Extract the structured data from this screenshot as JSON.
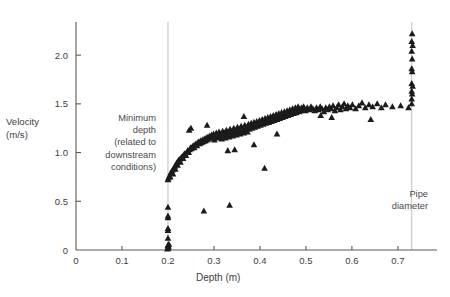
{
  "figure": {
    "background": "#ffffff",
    "marker_color": "#1b1b1b",
    "axis_color": "#5a5a5a",
    "reference_line_color": "#b9b9b9"
  },
  "labels": {
    "y_axis_line1": "Velocity",
    "y_axis_line2": "(m/s)",
    "x_axis": "Depth (m)",
    "annotation_left_line1": "Minimum",
    "annotation_left_line2": "depth",
    "annotation_left_line3": "(related to",
    "annotation_left_line4": "downstream",
    "annotation_left_line5": "conditions)",
    "annotation_right_line1": "Pipe",
    "annotation_right_line2": "diameter"
  },
  "chart_data": {
    "type": "scatter",
    "title": "",
    "xlabel": "Depth (m)",
    "ylabel": "Velocity (m/s)",
    "xlim": [
      0,
      0.785
    ],
    "ylim": [
      0,
      2.34
    ],
    "grid": false,
    "legend": null,
    "marker": "triangle-up",
    "marker_color": "#1b1b1b",
    "xticks": [
      0,
      0.1,
      0.2,
      0.3,
      0.4,
      0.5,
      0.6,
      0.7
    ],
    "xticklabels": [
      "0",
      "0.1",
      "0.2",
      "0.3",
      "0.4",
      "0.5",
      "0.6",
      "0.7"
    ],
    "yticks": [
      0,
      0.5,
      1.0,
      1.5,
      2.0
    ],
    "yticklabels": [
      "0",
      "0.5",
      "1.0",
      "1.5",
      "2.0"
    ],
    "annotations": [
      {
        "text": "Minimum depth (related to downstream conditions)",
        "x": 0.2,
        "type": "vertical-reference-line",
        "line_x": 0.2,
        "line_y_from": 0,
        "line_y_to": 2.34
      },
      {
        "text": "Pipe diameter",
        "x": 0.73,
        "type": "vertical-reference-line",
        "line_x": 0.73,
        "line_y_from": 0,
        "line_y_to": 2.34
      }
    ],
    "points": [
      [
        0.2,
        0.02
      ],
      [
        0.2,
        0.04
      ],
      [
        0.2,
        0.05
      ],
      [
        0.201,
        0.03
      ],
      [
        0.202,
        0.06
      ],
      [
        0.199,
        0.01
      ],
      [
        0.2,
        0.12
      ],
      [
        0.2,
        0.2
      ],
      [
        0.2,
        0.22
      ],
      [
        0.2,
        0.33
      ],
      [
        0.2,
        0.35
      ],
      [
        0.2,
        0.44
      ],
      [
        0.278,
        0.4
      ],
      [
        0.334,
        0.46
      ],
      [
        0.2,
        0.72
      ],
      [
        0.201,
        0.74
      ],
      [
        0.203,
        0.76
      ],
      [
        0.205,
        0.75
      ],
      [
        0.206,
        0.79
      ],
      [
        0.208,
        0.8
      ],
      [
        0.21,
        0.82
      ],
      [
        0.211,
        0.78
      ],
      [
        0.213,
        0.84
      ],
      [
        0.215,
        0.86
      ],
      [
        0.216,
        0.83
      ],
      [
        0.218,
        0.88
      ],
      [
        0.22,
        0.9
      ],
      [
        0.221,
        0.87
      ],
      [
        0.223,
        0.92
      ],
      [
        0.225,
        0.93
      ],
      [
        0.227,
        0.9
      ],
      [
        0.229,
        0.95
      ],
      [
        0.231,
        0.96
      ],
      [
        0.233,
        0.94
      ],
      [
        0.235,
        0.98
      ],
      [
        0.237,
        0.99
      ],
      [
        0.239,
        0.97
      ],
      [
        0.241,
        1.0
      ],
      [
        0.243,
        1.02
      ],
      [
        0.245,
        1.0
      ],
      [
        0.247,
        1.03
      ],
      [
        0.249,
        1.05
      ],
      [
        0.246,
        1.23
      ],
      [
        0.25,
        1.25
      ],
      [
        0.251,
        1.04
      ],
      [
        0.253,
        1.06
      ],
      [
        0.255,
        1.07
      ],
      [
        0.257,
        1.05
      ],
      [
        0.259,
        1.08
      ],
      [
        0.261,
        1.09
      ],
      [
        0.263,
        1.07
      ],
      [
        0.265,
        1.1
      ],
      [
        0.267,
        1.11
      ],
      [
        0.269,
        1.09
      ],
      [
        0.271,
        1.12
      ],
      [
        0.273,
        1.1
      ],
      [
        0.275,
        1.13
      ],
      [
        0.277,
        1.11
      ],
      [
        0.279,
        1.14
      ],
      [
        0.281,
        1.12
      ],
      [
        0.283,
        1.15
      ],
      [
        0.285,
        1.13
      ],
      [
        0.287,
        1.16
      ],
      [
        0.289,
        1.14
      ],
      [
        0.285,
        1.28
      ],
      [
        0.291,
        1.17
      ],
      [
        0.293,
        1.15
      ],
      [
        0.295,
        1.18
      ],
      [
        0.297,
        1.16
      ],
      [
        0.299,
        1.19
      ],
      [
        0.301,
        1.13
      ],
      [
        0.303,
        1.17
      ],
      [
        0.305,
        1.2
      ],
      [
        0.307,
        1.15
      ],
      [
        0.309,
        1.18
      ],
      [
        0.311,
        1.21
      ],
      [
        0.313,
        1.16
      ],
      [
        0.315,
        1.19
      ],
      [
        0.317,
        1.14
      ],
      [
        0.319,
        1.22
      ],
      [
        0.321,
        1.17
      ],
      [
        0.323,
        1.2
      ],
      [
        0.325,
        1.15
      ],
      [
        0.327,
        1.23
      ],
      [
        0.329,
        1.18
      ],
      [
        0.331,
        1.21
      ],
      [
        0.333,
        1.16
      ],
      [
        0.335,
        1.24
      ],
      [
        0.337,
        1.19
      ],
      [
        0.339,
        1.22
      ],
      [
        0.341,
        1.17
      ],
      [
        0.343,
        1.25
      ],
      [
        0.345,
        1.2
      ],
      [
        0.33,
        1.02
      ],
      [
        0.345,
        1.03
      ],
      [
        0.347,
        1.23
      ],
      [
        0.349,
        1.18
      ],
      [
        0.351,
        1.26
      ],
      [
        0.353,
        1.21
      ],
      [
        0.355,
        1.24
      ],
      [
        0.357,
        1.19
      ],
      [
        0.359,
        1.27
      ],
      [
        0.361,
        1.22
      ],
      [
        0.363,
        1.25
      ],
      [
        0.365,
        1.2
      ],
      [
        0.367,
        1.28
      ],
      [
        0.369,
        1.23
      ],
      [
        0.365,
        1.37
      ],
      [
        0.371,
        1.26
      ],
      [
        0.373,
        1.21
      ],
      [
        0.375,
        1.29
      ],
      [
        0.377,
        1.24
      ],
      [
        0.379,
        1.27
      ],
      [
        0.381,
        1.3
      ],
      [
        0.383,
        1.25
      ],
      [
        0.385,
        1.28
      ],
      [
        0.387,
        1.31
      ],
      [
        0.389,
        1.26
      ],
      [
        0.391,
        1.29
      ],
      [
        0.393,
        1.32
      ],
      [
        0.387,
        1.08
      ],
      [
        0.41,
        0.84
      ],
      [
        0.395,
        1.27
      ],
      [
        0.397,
        1.3
      ],
      [
        0.399,
        1.33
      ],
      [
        0.401,
        1.28
      ],
      [
        0.403,
        1.31
      ],
      [
        0.405,
        1.34
      ],
      [
        0.407,
        1.29
      ],
      [
        0.409,
        1.32
      ],
      [
        0.411,
        1.35
      ],
      [
        0.413,
        1.3
      ],
      [
        0.415,
        1.33
      ],
      [
        0.417,
        1.36
      ],
      [
        0.419,
        1.31
      ],
      [
        0.421,
        1.34
      ],
      [
        0.423,
        1.37
      ],
      [
        0.425,
        1.32
      ],
      [
        0.427,
        1.35
      ],
      [
        0.429,
        1.38
      ],
      [
        0.431,
        1.33
      ],
      [
        0.433,
        1.36
      ],
      [
        0.435,
        1.39
      ],
      [
        0.437,
        1.34
      ],
      [
        0.439,
        1.37
      ],
      [
        0.441,
        1.4
      ],
      [
        0.443,
        1.35
      ],
      [
        0.445,
        1.38
      ],
      [
        0.447,
        1.41
      ],
      [
        0.449,
        1.36
      ],
      [
        0.437,
        1.19
      ],
      [
        0.451,
        1.39
      ],
      [
        0.453,
        1.42
      ],
      [
        0.455,
        1.37
      ],
      [
        0.457,
        1.4
      ],
      [
        0.459,
        1.43
      ],
      [
        0.461,
        1.38
      ],
      [
        0.463,
        1.41
      ],
      [
        0.465,
        1.44
      ],
      [
        0.467,
        1.39
      ],
      [
        0.469,
        1.42
      ],
      [
        0.471,
        1.45
      ],
      [
        0.473,
        1.4
      ],
      [
        0.475,
        1.43
      ],
      [
        0.477,
        1.46
      ],
      [
        0.479,
        1.41
      ],
      [
        0.481,
        1.44
      ],
      [
        0.483,
        1.47
      ],
      [
        0.485,
        1.42
      ],
      [
        0.487,
        1.45
      ],
      [
        0.489,
        1.43
      ],
      [
        0.491,
        1.46
      ],
      [
        0.493,
        1.44
      ],
      [
        0.495,
        1.47
      ],
      [
        0.497,
        1.45
      ],
      [
        0.499,
        1.43
      ],
      [
        0.503,
        1.46
      ],
      [
        0.507,
        1.44
      ],
      [
        0.511,
        1.47
      ],
      [
        0.515,
        1.45
      ],
      [
        0.519,
        1.43
      ],
      [
        0.523,
        1.46
      ],
      [
        0.527,
        1.44
      ],
      [
        0.531,
        1.47
      ],
      [
        0.535,
        1.45
      ],
      [
        0.539,
        1.42
      ],
      [
        0.543,
        1.46
      ],
      [
        0.547,
        1.44
      ],
      [
        0.551,
        1.47
      ],
      [
        0.555,
        1.45
      ],
      [
        0.559,
        1.48
      ],
      [
        0.532,
        1.38
      ],
      [
        0.556,
        1.36
      ],
      [
        0.563,
        1.43
      ],
      [
        0.567,
        1.46
      ],
      [
        0.571,
        1.49
      ],
      [
        0.575,
        1.44
      ],
      [
        0.579,
        1.47
      ],
      [
        0.583,
        1.5
      ],
      [
        0.587,
        1.45
      ],
      [
        0.591,
        1.48
      ],
      [
        0.596,
        1.46
      ],
      [
        0.601,
        1.49
      ],
      [
        0.608,
        1.45
      ],
      [
        0.615,
        1.48
      ],
      [
        0.622,
        1.51
      ],
      [
        0.629,
        1.46
      ],
      [
        0.637,
        1.49
      ],
      [
        0.645,
        1.47
      ],
      [
        0.641,
        1.34
      ],
      [
        0.655,
        1.5
      ],
      [
        0.664,
        1.46
      ],
      [
        0.673,
        1.49
      ],
      [
        0.688,
        1.47
      ],
      [
        0.706,
        1.48
      ],
      [
        0.723,
        1.46
      ],
      [
        0.73,
        1.5
      ],
      [
        0.73,
        1.55
      ],
      [
        0.731,
        1.6
      ],
      [
        0.73,
        1.63
      ],
      [
        0.732,
        1.68
      ],
      [
        0.73,
        1.71
      ],
      [
        0.731,
        1.83
      ],
      [
        0.73,
        1.86
      ],
      [
        0.731,
        1.96
      ],
      [
        0.73,
        2.04
      ],
      [
        0.732,
        2.1
      ],
      [
        0.73,
        2.14
      ],
      [
        0.731,
        2.22
      ]
    ]
  }
}
